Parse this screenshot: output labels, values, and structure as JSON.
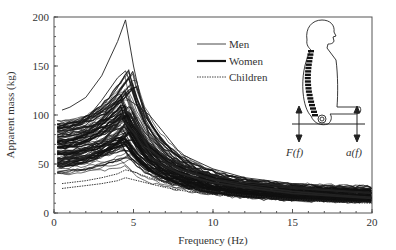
{
  "chart_data": {
    "type": "line",
    "title": "",
    "xlabel": "Frequency (Hz)",
    "ylabel": "Apparent mass (kg)",
    "xlim": [
      0,
      20
    ],
    "ylim": [
      0,
      200
    ],
    "xticks": [
      0,
      5,
      10,
      15,
      20
    ],
    "yticks": [
      0,
      50,
      100,
      150,
      200
    ],
    "grid": false,
    "legend_position": "upper-center",
    "legend": [
      {
        "name": "Men",
        "style": "thin-solid"
      },
      {
        "name": "Women",
        "style": "thick-solid"
      },
      {
        "name": "Children",
        "style": "dotted"
      }
    ],
    "x": [
      0.5,
      1,
      2,
      3,
      4,
      4.5,
      5,
      6,
      7,
      8,
      10,
      12,
      15,
      18,
      20
    ],
    "series": [
      {
        "name": "Men (highest peak)",
        "group": "Men",
        "values": [
          105,
          108,
          118,
          140,
          175,
          197,
          150,
          75,
          55,
          45,
          35,
          30,
          25,
          22,
          20
        ]
      },
      {
        "name": "Men (2nd peak)",
        "group": "Men",
        "values": [
          80,
          85,
          95,
          115,
          138,
          145,
          125,
          80,
          60,
          50,
          38,
          32,
          27,
          23,
          21
        ]
      },
      {
        "name": "Men (high)",
        "group": "Men",
        "values": [
          72,
          75,
          82,
          95,
          110,
          118,
          112,
          100,
          80,
          60,
          45,
          36,
          30,
          27,
          25
        ]
      },
      {
        "name": "Women (typical)",
        "group": "Women",
        "values": [
          55,
          57,
          62,
          72,
          90,
          105,
          95,
          65,
          52,
          44,
          34,
          28,
          22,
          18,
          16
        ]
      },
      {
        "name": "Women (typical 2)",
        "group": "Women",
        "values": [
          50,
          52,
          57,
          65,
          80,
          92,
          82,
          58,
          47,
          40,
          31,
          26,
          20,
          17,
          15
        ]
      },
      {
        "name": "Men (typical)",
        "group": "Men",
        "values": [
          60,
          62,
          66,
          75,
          88,
          96,
          90,
          70,
          57,
          48,
          38,
          32,
          26,
          22,
          20
        ]
      },
      {
        "name": "Children (low)",
        "group": "Children",
        "values": [
          30,
          31,
          33,
          36,
          40,
          44,
          42,
          36,
          31,
          27,
          22,
          18,
          14,
          12,
          11
        ]
      },
      {
        "name": "Children (lowest)",
        "group": "Children",
        "values": [
          25,
          26,
          28,
          30,
          33,
          36,
          34,
          30,
          26,
          23,
          19,
          16,
          13,
          11,
          10
        ]
      }
    ],
    "band_summary": {
      "description": "Dense bundle of ~100 subject curves",
      "at_0Hz": [
        25,
        110
      ],
      "peak_freq_Hz": [
        4,
        5
      ],
      "at_20Hz": [
        10,
        25
      ]
    },
    "annotations": [
      "F(f)",
      "a(f)"
    ],
    "inset": "seated human figure with spine, force and acceleration arrows at seat"
  }
}
